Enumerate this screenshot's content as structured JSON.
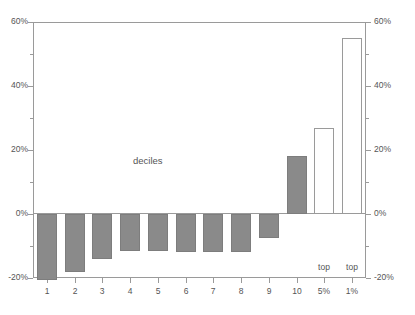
{
  "chart_data": {
    "type": "bar",
    "title": "",
    "subtitle": "",
    "xlabel": "",
    "ylabel": "",
    "ylim": [
      -20,
      60
    ],
    "grid": false,
    "legend_position": "none",
    "categories": [
      "1",
      "2",
      "3",
      "4",
      "5",
      "6",
      "7",
      "8",
      "9",
      "10",
      "top 5%",
      "top 1%"
    ],
    "category_lines": [
      {
        "top": "",
        "bottom": "1"
      },
      {
        "top": "",
        "bottom": "2"
      },
      {
        "top": "",
        "bottom": "3"
      },
      {
        "top": "",
        "bottom": "4"
      },
      {
        "top": "",
        "bottom": "5"
      },
      {
        "top": "",
        "bottom": "6"
      },
      {
        "top": "",
        "bottom": "7"
      },
      {
        "top": "",
        "bottom": "8"
      },
      {
        "top": "",
        "bottom": "9"
      },
      {
        "top": "",
        "bottom": "10"
      },
      {
        "top": "top",
        "bottom": "5%"
      },
      {
        "top": "top",
        "bottom": "1%"
      }
    ],
    "values": [
      -20.5,
      -18.0,
      -14.0,
      -11.5,
      -11.5,
      -12.0,
      -12.0,
      -12.0,
      -7.5,
      18.0,
      27.0,
      55.0
    ],
    "bar_styles": [
      "filled",
      "filled",
      "filled",
      "filled",
      "filled",
      "filled",
      "filled",
      "filled",
      "filled",
      "filled",
      "hollow",
      "hollow"
    ],
    "annotations": [
      {
        "text": "deciles",
        "x": 12,
        "y": 0.2
      }
    ],
    "y_ticks_major": [
      -20,
      0,
      20,
      40,
      60
    ],
    "y_ticks_major_labels": [
      "-20%",
      "0%",
      "20%",
      "40%",
      "60%"
    ],
    "y_ticks_minor": [
      -10,
      10,
      30,
      50
    ],
    "axis_left_labels": [
      "60%",
      "40%",
      "20%",
      "0%",
      "-20%"
    ],
    "axis_right_labels": [
      "60%",
      "40%",
      "20%",
      "0%",
      "-20%"
    ]
  },
  "colors": {
    "bar_fill": "#8a8a8a",
    "bar_stroke": "#7d7d7d",
    "hollow_fill": "#ffffff",
    "axis": "#9a9a9a",
    "text": "#555555",
    "background": "#ffffff"
  }
}
